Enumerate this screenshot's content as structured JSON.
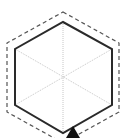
{
  "diagram": {
    "type": "hexagon-offset",
    "colors": {
      "background": "#ffffff",
      "solid_outline": "#2a2a2a",
      "dashed_outline": "#555555",
      "inner_lines": "#b8b8b8",
      "cursor": "#111111"
    },
    "solid_hexagon": {
      "points": "63,22 112,49 112,105 63,133 15,105 15,49"
    },
    "dashed_hexagon": {
      "points": "63,12 119,43 119,112 63,143 7,112 7,43"
    },
    "inner_diagonals": [
      {
        "x1": 63,
        "y1": 22,
        "x2": 63,
        "y2": 133
      },
      {
        "x1": 112,
        "y1": 49,
        "x2": 15,
        "y2": 105
      },
      {
        "x1": 112,
        "y1": 105,
        "x2": 15,
        "y2": 49
      }
    ],
    "cursor": {
      "icon": "arrow-cursor",
      "points": "73,126 80,138 66,138"
    }
  }
}
